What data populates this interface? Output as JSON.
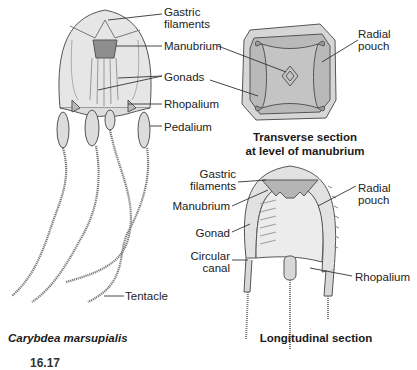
{
  "figure": {
    "species": "Carybdea marsupialis",
    "figure_number_partial": "16.17"
  },
  "whole_animal": {
    "labels": {
      "gastric_filaments": "Gastric\nfilaments",
      "gastric_filaments_l1": "Gastric",
      "gastric_filaments_l2": "filaments",
      "manubrium": "Manubrium",
      "gonads": "Gonads",
      "rhopalium": "Rhopalium",
      "pedalium": "Pedalium",
      "tentacle": "Tentacle"
    },
    "caption": "Carybdea marsupialis"
  },
  "transverse_section": {
    "labels": {
      "radial_pouch_l1": "Radial",
      "radial_pouch_l2": "pouch"
    },
    "caption_l1": "Transverse section",
    "caption_l2": "at level of manubrium"
  },
  "longitudinal_section": {
    "labels": {
      "gastric_filaments_l1": "Gastric",
      "gastric_filaments_l2": "filaments",
      "manubrium": "Manubrium",
      "gonad": "Gonad",
      "circular_canal_l1": "Circular",
      "circular_canal_l2": "canal",
      "radial_pouch_l1": "Radial",
      "radial_pouch_l2": "pouch",
      "rhopalium": "Rhopalium"
    },
    "caption": "Longitudinal section"
  },
  "colors": {
    "outline": "#555555",
    "fill_light": "#e8e8e8",
    "fill_mid": "#c8c8c8",
    "fill_dark": "#9a9a9a",
    "leader": "#333333"
  }
}
